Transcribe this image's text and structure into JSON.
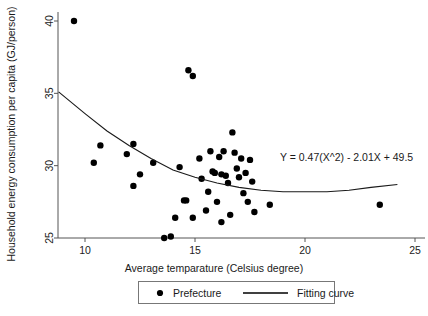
{
  "chart_data": {
    "type": "scatter",
    "title": "",
    "xlabel": "Average temparature (Celsius degree)",
    "ylabel": "Household energy consumption per capita (GJ/person)",
    "xlim": [
      8.3,
      25.6
    ],
    "ylim": [
      24.1,
      40.8
    ],
    "xticks": [
      10,
      15,
      20,
      25
    ],
    "xtick_labels": [
      "10",
      "15",
      "20",
      "25"
    ],
    "yticks": [
      25,
      30,
      35,
      40
    ],
    "ytick_labels": [
      "25",
      "30",
      "35",
      "40"
    ],
    "grid": false,
    "legend_position": "below-axes",
    "annotation": "Y = 0.47(X^2) - 2.01X + 49.5",
    "series": [
      {
        "name": "Prefecture",
        "marker": "filled-circle",
        "color": "#000000",
        "points": [
          [
            9.5,
            40.0
          ],
          [
            10.4,
            30.2
          ],
          [
            10.7,
            31.4
          ],
          [
            11.9,
            30.8
          ],
          [
            12.2,
            31.5
          ],
          [
            12.2,
            28.6
          ],
          [
            12.5,
            29.4
          ],
          [
            13.1,
            30.2
          ],
          [
            13.6,
            25.0
          ],
          [
            13.9,
            25.1
          ],
          [
            14.1,
            26.4
          ],
          [
            14.3,
            29.9
          ],
          [
            14.5,
            27.6
          ],
          [
            14.6,
            27.6
          ],
          [
            14.7,
            36.6
          ],
          [
            14.9,
            36.2
          ],
          [
            14.9,
            26.4
          ],
          [
            15.2,
            30.5
          ],
          [
            15.3,
            29.1
          ],
          [
            15.5,
            26.9
          ],
          [
            15.6,
            28.2
          ],
          [
            15.7,
            31.0
          ],
          [
            15.8,
            29.6
          ],
          [
            15.9,
            29.5
          ],
          [
            16.0,
            27.5
          ],
          [
            16.1,
            30.6
          ],
          [
            16.2,
            29.4
          ],
          [
            16.2,
            26.1
          ],
          [
            16.3,
            31.0
          ],
          [
            16.4,
            29.3
          ],
          [
            16.5,
            28.8
          ],
          [
            16.6,
            26.6
          ],
          [
            16.7,
            32.3
          ],
          [
            16.8,
            30.9
          ],
          [
            16.9,
            29.8
          ],
          [
            17.0,
            29.2
          ],
          [
            17.1,
            30.5
          ],
          [
            17.2,
            28.1
          ],
          [
            17.3,
            29.5
          ],
          [
            17.4,
            27.5
          ],
          [
            17.5,
            30.4
          ],
          [
            17.6,
            28.9
          ],
          [
            17.7,
            26.8
          ],
          [
            18.4,
            27.3
          ],
          [
            23.4,
            27.3
          ]
        ]
      },
      {
        "name": "Fitting curve",
        "type": "line",
        "color": "#1a1a1a",
        "equation": "Y = 0.47(X^2) - 2.01X + 49.5",
        "x_range": [
          8.8,
          24.2
        ],
        "curve_points": [
          [
            8.8,
            35.1
          ],
          [
            10.0,
            33.6
          ],
          [
            11.0,
            32.4
          ],
          [
            12.0,
            31.4
          ],
          [
            13.0,
            30.5
          ],
          [
            14.0,
            29.7
          ],
          [
            15.0,
            29.2
          ],
          [
            16.0,
            28.8
          ],
          [
            17.0,
            28.5
          ],
          [
            18.0,
            28.3
          ],
          [
            19.0,
            28.2
          ],
          [
            20.0,
            28.2
          ],
          [
            21.0,
            28.2
          ],
          [
            22.0,
            28.3
          ],
          [
            23.0,
            28.5
          ],
          [
            24.2,
            28.7
          ]
        ]
      }
    ],
    "legend_entries": [
      {
        "label": "Prefecture",
        "marker": "filled-circle"
      },
      {
        "label": "Fitting curve",
        "marker": "line"
      }
    ]
  }
}
